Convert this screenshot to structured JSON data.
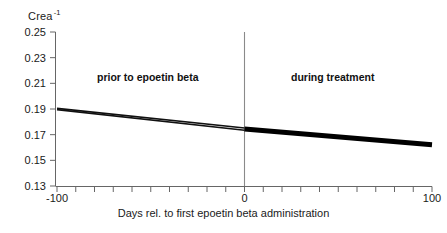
{
  "chart_data": {
    "type": "line",
    "title": "",
    "subtitle": "",
    "ylabel": "Crea",
    "ylabel_exponent": "-1",
    "xlabel": "Days rel. to first epoetin beta administration",
    "xlim": [
      -100,
      100
    ],
    "ylim": [
      0.13,
      0.25
    ],
    "yticks": [
      "0.25",
      "0.23",
      "0.21",
      "0.19",
      "0.17",
      "0.15",
      "0.13"
    ],
    "ytick_values": [
      0.25,
      0.23,
      0.21,
      0.19,
      0.17,
      0.15,
      0.13
    ],
    "xticks": [
      "-100",
      "0",
      "100"
    ],
    "xtick_values": [
      -100,
      0,
      100
    ],
    "xtick_minor_step": 10,
    "grid": false,
    "legend": "none",
    "annotations": [
      {
        "text": "prior to epoetin beta",
        "x": -50,
        "y": 0.222
      },
      {
        "text": "during treatment",
        "x": 52,
        "y": 0.222
      }
    ],
    "reference_line": {
      "x": 0,
      "orientation": "vertical",
      "color": "#666666"
    },
    "series": [
      {
        "name": "upper regression line (prior to epoetin beta)",
        "style": "thin",
        "color": "#111111",
        "x": [
          -100,
          0
        ],
        "values": [
          0.1905,
          0.1752
        ]
      },
      {
        "name": "lower regression line (prior to epoetin beta)",
        "style": "thin",
        "color": "#111111",
        "x": [
          -100,
          0
        ],
        "values": [
          0.1895,
          0.1734
        ]
      },
      {
        "name": "regression line (during treatment)",
        "style": "thick",
        "color": "#000000",
        "x": [
          0,
          100
        ],
        "values": [
          0.1745,
          0.1622
        ]
      }
    ]
  },
  "axis_colors": {
    "axis": "#666666",
    "tick": "#666666",
    "reference": "#8a8a8a",
    "text": "#1a1a1a"
  }
}
